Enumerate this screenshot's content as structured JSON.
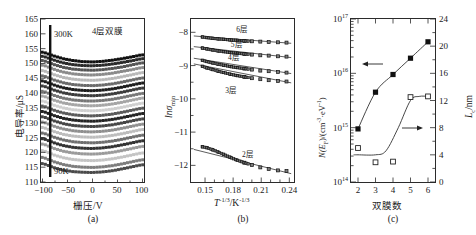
{
  "figure": {
    "panels": [
      "a",
      "b",
      "c"
    ]
  },
  "panel_a": {
    "caption": "(a)",
    "ylabel": "电导率/μS",
    "xlabel": "栅压/V",
    "annotation_top": "4层双膜",
    "annotation_hot": "300K",
    "annotation_cold": "90K",
    "xticks": [
      "-100",
      "-50",
      "0",
      "50",
      "100"
    ],
    "yticks": [
      "110",
      "115",
      "120",
      "125",
      "130",
      "135",
      "140",
      "145",
      "150",
      "155",
      "160",
      "165"
    ]
  },
  "panel_b": {
    "caption": "(b)",
    "ylabel_main": "lnσ",
    "ylabel_sub": "min",
    "xlabel_main": "T",
    "xlabel_sup1": "-1/3",
    "xlabel_mid": "/K",
    "xlabel_sup2": "-1/3",
    "xticks": [
      "0.15",
      "0.18",
      "0.21",
      "0.24"
    ],
    "yticks": [
      "-8",
      "-9",
      "-10",
      "-11",
      "-12"
    ],
    "curve_labels": [
      "6层",
      "5层",
      "4层",
      "3层",
      "2层"
    ]
  },
  "panel_c": {
    "caption": "(c)",
    "xlabel": "双膜数",
    "ylabel_left_main": "N(E",
    "ylabel_left_sub": "F",
    "ylabel_left_tail": ")/(cm",
    "ylabel_left_sup1": "-3",
    "ylabel_left_mid": "·eV",
    "ylabel_left_sup2": "-1",
    "ylabel_left_end": ")",
    "ylabel_right_main": "L",
    "ylabel_right_sub": "c",
    "ylabel_right_tail": "/nm",
    "xticks": [
      "2",
      "3",
      "4",
      "5",
      "6"
    ],
    "yticks_left": [
      "10¹⁴",
      "10¹⁵",
      "10¹⁶",
      "10¹⁷"
    ],
    "yticks_right": [
      "0",
      "4",
      "8",
      "12",
      "16",
      "20",
      "24"
    ],
    "arrow_left_label": "←",
    "arrow_right_label": "→"
  },
  "chart_data": [
    {
      "type": "line",
      "panel": "a",
      "title": "4层双膜",
      "xlabel": "栅压/V",
      "ylabel": "电导率/μS",
      "xlim": [
        -105,
        105
      ],
      "ylim": [
        110,
        165
      ],
      "xticks": [
        -100,
        -50,
        0,
        50,
        100
      ],
      "yticks": [
        110,
        115,
        120,
        125,
        130,
        135,
        140,
        145,
        150,
        155,
        160,
        165
      ],
      "grid": false,
      "legend": "none",
      "annotations": [
        {
          "text": "300K",
          "x": -72,
          "y": 157
        },
        {
          "text": "90K",
          "x": -70,
          "y": 114
        },
        {
          "text": "4层双膜",
          "x": 25,
          "y": 160
        }
      ],
      "notes": "Family of ~22 gate-sweep transfer curves, one per temperature from 300K (top) to 90K (bottom); each curve is a shallow U shape with minimum near 0 V.",
      "series": [
        {
          "name": "300K",
          "x": [
            -100,
            -80,
            -60,
            -40,
            -20,
            0,
            20,
            40,
            60,
            80,
            100
          ],
          "values": [
            153.8,
            152.6,
            151.6,
            151.0,
            150.6,
            150.5,
            150.7,
            151.1,
            151.6,
            152.2,
            152.9
          ]
        },
        {
          "name": "T2",
          "x": [
            -100,
            -80,
            -60,
            -40,
            -20,
            0,
            20,
            40,
            60,
            80,
            100
          ],
          "values": [
            152.4,
            151.2,
            150.2,
            149.6,
            149.3,
            149.2,
            149.4,
            149.8,
            150.3,
            150.9,
            151.6
          ]
        },
        {
          "name": "T3",
          "x": [
            -100,
            -80,
            -60,
            -40,
            -20,
            0,
            20,
            40,
            60,
            80,
            100
          ],
          "values": [
            151.0,
            149.7,
            148.7,
            148.1,
            147.8,
            147.7,
            147.9,
            148.3,
            148.8,
            149.5,
            150.2
          ]
        },
        {
          "name": "T4",
          "x": [
            -100,
            -80,
            -60,
            -40,
            -20,
            0,
            20,
            40,
            60,
            80,
            100
          ],
          "values": [
            149.4,
            148.1,
            147.1,
            146.5,
            146.2,
            146.1,
            146.3,
            146.7,
            147.3,
            147.9,
            148.6
          ]
        },
        {
          "name": "T5",
          "x": [
            -100,
            -80,
            -60,
            -40,
            -20,
            0,
            20,
            40,
            60,
            80,
            100
          ],
          "values": [
            147.6,
            146.3,
            145.3,
            144.7,
            144.4,
            144.3,
            144.5,
            144.9,
            145.5,
            146.2,
            146.9
          ]
        },
        {
          "name": "T6",
          "x": [
            -100,
            -80,
            -60,
            -40,
            -20,
            0,
            20,
            40,
            60,
            80,
            100
          ],
          "values": [
            145.8,
            144.5,
            143.5,
            142.9,
            142.6,
            142.5,
            142.7,
            143.1,
            143.7,
            144.4,
            145.1
          ]
        },
        {
          "name": "T7",
          "x": [
            -100,
            -80,
            -60,
            -40,
            -20,
            0,
            20,
            40,
            60,
            80,
            100
          ],
          "values": [
            144.1,
            142.8,
            141.8,
            141.2,
            140.9,
            140.8,
            141.0,
            141.4,
            142.0,
            142.7,
            143.4
          ]
        },
        {
          "name": "T8",
          "x": [
            -100,
            -80,
            -60,
            -40,
            -20,
            0,
            20,
            40,
            60,
            80,
            100
          ],
          "values": [
            142.4,
            141.1,
            140.1,
            139.5,
            139.2,
            139.1,
            139.3,
            139.7,
            140.3,
            141.0,
            141.7
          ]
        },
        {
          "name": "T9",
          "x": [
            -100,
            -80,
            -60,
            -40,
            -20,
            0,
            20,
            40,
            60,
            80,
            100
          ],
          "values": [
            140.6,
            139.3,
            138.3,
            137.7,
            137.4,
            137.3,
            137.5,
            137.9,
            138.5,
            139.2,
            139.9
          ]
        },
        {
          "name": "T10",
          "x": [
            -100,
            -80,
            -60,
            -40,
            -20,
            0,
            20,
            40,
            60,
            80,
            100
          ],
          "values": [
            139.0,
            137.7,
            136.7,
            136.1,
            135.8,
            135.7,
            135.9,
            136.3,
            136.9,
            137.6,
            138.3
          ]
        },
        {
          "name": "T11",
          "x": [
            -100,
            -80,
            -60,
            -40,
            -20,
            0,
            20,
            40,
            60,
            80,
            100
          ],
          "values": [
            137.3,
            136.0,
            135.0,
            134.4,
            134.1,
            134.0,
            134.2,
            134.6,
            135.2,
            135.9,
            136.6
          ]
        },
        {
          "name": "T12",
          "x": [
            -100,
            -80,
            -60,
            -40,
            -20,
            0,
            20,
            40,
            60,
            80,
            100
          ],
          "values": [
            135.6,
            134.3,
            133.3,
            132.7,
            132.4,
            132.3,
            132.5,
            132.9,
            133.5,
            134.2,
            134.9
          ]
        },
        {
          "name": "T13",
          "x": [
            -100,
            -80,
            -60,
            -40,
            -20,
            0,
            20,
            40,
            60,
            80,
            100
          ],
          "values": [
            133.8,
            132.5,
            131.5,
            130.9,
            130.6,
            130.5,
            130.7,
            131.1,
            131.7,
            132.4,
            133.1
          ]
        },
        {
          "name": "T14",
          "x": [
            -100,
            -80,
            -60,
            -40,
            -20,
            0,
            20,
            40,
            60,
            80,
            100
          ],
          "values": [
            132.0,
            130.7,
            129.7,
            129.1,
            128.8,
            128.7,
            128.9,
            129.3,
            129.9,
            130.6,
            131.3
          ]
        },
        {
          "name": "T15",
          "x": [
            -100,
            -80,
            -60,
            -40,
            -20,
            0,
            20,
            40,
            60,
            80,
            100
          ],
          "values": [
            130.2,
            128.9,
            127.9,
            127.3,
            127.0,
            126.9,
            127.1,
            127.5,
            128.1,
            128.8,
            129.5
          ]
        },
        {
          "name": "T16",
          "x": [
            -100,
            -80,
            -60,
            -40,
            -20,
            0,
            20,
            40,
            60,
            80,
            100
          ],
          "values": [
            128.4,
            127.1,
            126.1,
            125.5,
            125.2,
            125.1,
            125.3,
            125.7,
            126.3,
            127.0,
            127.7
          ]
        },
        {
          "name": "T17",
          "x": [
            -100,
            -80,
            -60,
            -40,
            -20,
            0,
            20,
            40,
            60,
            80,
            100
          ],
          "values": [
            126.5,
            125.2,
            124.2,
            123.6,
            123.3,
            123.2,
            123.4,
            123.8,
            124.4,
            125.1,
            125.8
          ]
        },
        {
          "name": "T18",
          "x": [
            -100,
            -80,
            -60,
            -40,
            -20,
            0,
            20,
            40,
            60,
            80,
            100
          ],
          "values": [
            124.6,
            123.3,
            122.3,
            121.7,
            121.4,
            121.3,
            121.5,
            121.9,
            122.5,
            123.2,
            123.9
          ]
        },
        {
          "name": "T19",
          "x": [
            -100,
            -80,
            -60,
            -40,
            -20,
            0,
            20,
            40,
            60,
            80,
            100
          ],
          "values": [
            122.8,
            121.4,
            120.4,
            119.8,
            119.5,
            119.4,
            119.6,
            120.0,
            120.6,
            121.3,
            122.0
          ]
        },
        {
          "name": "T20",
          "x": [
            -100,
            -80,
            -60,
            -40,
            -20,
            0,
            20,
            40,
            60,
            80,
            100
          ],
          "values": [
            120.6,
            119.2,
            118.2,
            117.6,
            117.3,
            117.2,
            117.4,
            117.8,
            118.4,
            119.1,
            119.8
          ]
        },
        {
          "name": "T21",
          "x": [
            -100,
            -80,
            -60,
            -40,
            -20,
            0,
            20,
            40,
            60,
            80,
            100
          ],
          "values": [
            118.3,
            116.9,
            115.9,
            115.3,
            115.0,
            114.9,
            115.1,
            115.5,
            116.1,
            116.8,
            117.5
          ]
        },
        {
          "name": "90K",
          "x": [
            -100,
            -80,
            -60,
            -40,
            -20,
            0,
            20,
            40,
            60,
            80,
            100
          ],
          "values": [
            116.2,
            114.9,
            114.0,
            113.5,
            113.3,
            113.2,
            113.4,
            113.8,
            114.4,
            115.1,
            115.8
          ]
        }
      ]
    },
    {
      "type": "scatter",
      "panel": "b",
      "title": "",
      "xlabel": "T^-1/3 / K^-1/3",
      "ylabel": "lnσmin",
      "xlim": [
        0.135,
        0.245
      ],
      "ylim": [
        -12.5,
        -7.6
      ],
      "xticks": [
        0.15,
        0.18,
        0.21,
        0.24
      ],
      "yticks": [
        -8,
        -9,
        -10,
        -11,
        -12
      ],
      "grid": false,
      "legend": "inline labels",
      "series": [
        {
          "name": "6层",
          "x": [
            0.147,
            0.152,
            0.158,
            0.164,
            0.17,
            0.177,
            0.184,
            0.192,
            0.2,
            0.209,
            0.218,
            0.228,
            0.237
          ],
          "values": [
            -8.14,
            -8.16,
            -8.18,
            -8.2,
            -8.21,
            -8.23,
            -8.24,
            -8.26,
            -8.27,
            -8.28,
            -8.29,
            -8.3,
            -8.31
          ]
        },
        {
          "name": "5层",
          "x": [
            0.147,
            0.152,
            0.158,
            0.164,
            0.17,
            0.177,
            0.184,
            0.192,
            0.2,
            0.209,
            0.218,
            0.228,
            0.237
          ],
          "values": [
            -8.47,
            -8.5,
            -8.53,
            -8.56,
            -8.58,
            -8.61,
            -8.63,
            -8.65,
            -8.67,
            -8.69,
            -8.7,
            -8.72,
            -8.73
          ]
        },
        {
          "name": "4层",
          "x": [
            0.147,
            0.152,
            0.158,
            0.164,
            0.17,
            0.177,
            0.184,
            0.192,
            0.2,
            0.209,
            0.218,
            0.228,
            0.237
          ],
          "values": [
            -8.84,
            -8.88,
            -8.92,
            -8.96,
            -8.99,
            -9.03,
            -9.06,
            -9.09,
            -9.12,
            -9.15,
            -9.17,
            -9.19,
            -9.21
          ]
        },
        {
          "name": "3层",
          "x": [
            0.147,
            0.152,
            0.158,
            0.164,
            0.17,
            0.177,
            0.184,
            0.192,
            0.2,
            0.209,
            0.218,
            0.228,
            0.237
          ],
          "values": [
            -9.02,
            -9.07,
            -9.12,
            -9.17,
            -9.21,
            -9.26,
            -9.3,
            -9.34,
            -9.38,
            -9.41,
            -9.44,
            -9.46,
            -9.48
          ]
        },
        {
          "name": "2层",
          "x": [
            0.147,
            0.152,
            0.158,
            0.164,
            0.17,
            0.177,
            0.184,
            0.192,
            0.2,
            0.209,
            0.218,
            0.228,
            0.237
          ],
          "values": [
            -11.44,
            -11.47,
            -11.53,
            -11.6,
            -11.67,
            -11.76,
            -11.84,
            -11.92,
            -11.99,
            -12.06,
            -12.11,
            -12.15,
            -12.17
          ]
        }
      ],
      "fit_lines": [
        {
          "name": "6层 fit",
          "x": [
            0.138,
            0.242
          ],
          "values": [
            -8.11,
            -8.33
          ]
        },
        {
          "name": "5层 fit",
          "x": [
            0.138,
            0.242
          ],
          "values": [
            -8.43,
            -8.76
          ]
        },
        {
          "name": "4层 fit",
          "x": [
            0.138,
            0.242
          ],
          "values": [
            -8.78,
            -9.24
          ]
        },
        {
          "name": "3层 fit",
          "x": [
            0.138,
            0.242
          ],
          "values": [
            -8.95,
            -9.52
          ]
        },
        {
          "name": "2层 fit",
          "x": [
            0.138,
            0.242
          ],
          "values": [
            -11.52,
            -12.25
          ]
        }
      ]
    },
    {
      "type": "line",
      "panel": "c",
      "title": "",
      "xlabel": "双膜数",
      "ylabel": "N(E_F)/(cm^-3·eV^-1)",
      "ylabel2": "L_c/nm",
      "xlim": [
        1.6,
        6.4
      ],
      "ylim": [
        100000000000000.0,
        1e+17
      ],
      "ylim2": [
        0,
        24
      ],
      "yscale": "log",
      "xticks": [
        2,
        3,
        4,
        5,
        6
      ],
      "yticks_left": [
        100000000000000.0,
        1000000000000000.0,
        1e+16,
        1e+17
      ],
      "yticks_right": [
        0,
        4,
        8,
        12,
        16,
        20,
        24
      ],
      "grid": false,
      "legend": "arrows pointing to owning axis",
      "series": [
        {
          "name": "N(EF)",
          "axis": "left",
          "marker": "filled-square",
          "x": [
            2,
            3,
            4,
            5,
            6
          ],
          "values": [
            950000000000000.0,
            4500000000000000.0,
            9500000000000000.0,
            1.9e+16,
            3.8e+16
          ]
        },
        {
          "name": "Lc",
          "axis": "right",
          "marker": "open-square",
          "x": [
            2,
            3,
            4,
            5,
            6
          ],
          "values": [
            5.0,
            2.9,
            3.0,
            12.5,
            12.6
          ]
        }
      ]
    }
  ]
}
